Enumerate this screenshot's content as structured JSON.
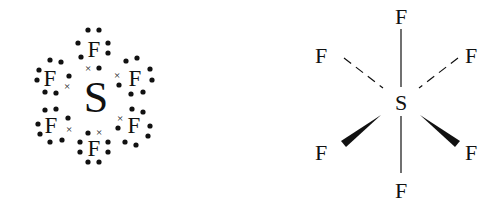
{
  "molecule": "SF6",
  "lewis_structure": {
    "central_atom": "S",
    "ligand_label": "F",
    "ligand_count": 6,
    "lone_pair_dot_symbol": "•",
    "shared_electron_from_S_symbol": "×"
  },
  "spatial_structure": {
    "central_atom": "S",
    "ligands": [
      {
        "label": "F",
        "position": "top",
        "bond": "solid"
      },
      {
        "label": "F",
        "position": "upper-left",
        "bond": "dashed"
      },
      {
        "label": "F",
        "position": "upper-right",
        "bond": "dashed"
      },
      {
        "label": "F",
        "position": "lower-left",
        "bond": "wedge"
      },
      {
        "label": "F",
        "position": "lower-right",
        "bond": "wedge"
      },
      {
        "label": "F",
        "position": "bottom",
        "bond": "solid"
      }
    ]
  },
  "colors": {
    "ink": "#111111",
    "background": "#ffffff"
  }
}
